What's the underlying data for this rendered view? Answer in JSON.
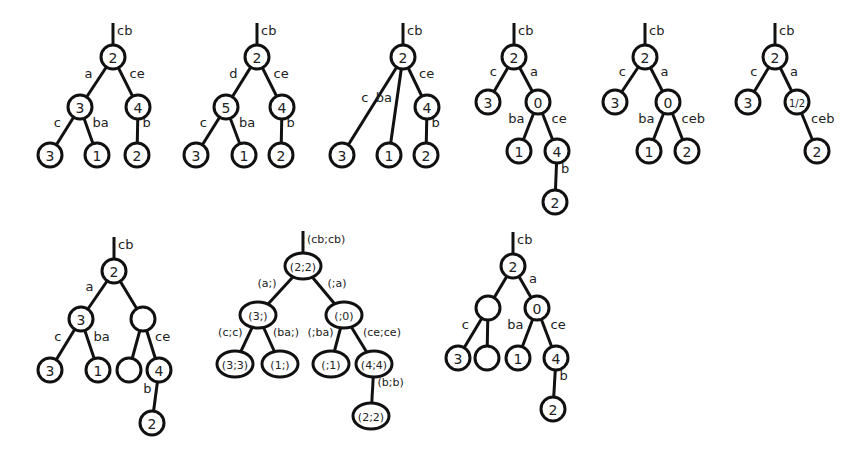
{
  "figure": {
    "trees": [
      {
        "id": "tree-1",
        "root_edge": "cb",
        "nodes": [
          {
            "id": "r",
            "label": "2",
            "x": 113,
            "y": 57
          },
          {
            "id": "a",
            "label": "3",
            "x": 80,
            "y": 107
          },
          {
            "id": "b",
            "label": "4",
            "x": 138,
            "y": 107
          },
          {
            "id": "c",
            "label": "3",
            "x": 50,
            "y": 155
          },
          {
            "id": "d",
            "label": "1",
            "x": 97,
            "y": 155
          },
          {
            "id": "e",
            "label": "2",
            "x": 137,
            "y": 155
          }
        ],
        "edges": [
          {
            "from": "r",
            "to": "a",
            "label": "a"
          },
          {
            "from": "r",
            "to": "b",
            "label": "ce"
          },
          {
            "from": "a",
            "to": "c",
            "label": "c"
          },
          {
            "from": "a",
            "to": "d",
            "label": "ba"
          },
          {
            "from": "b",
            "to": "e",
            "label": "b"
          }
        ]
      },
      {
        "id": "tree-2",
        "root_edge": "cb",
        "nodes": [
          {
            "id": "r",
            "label": "2",
            "x": 257,
            "y": 57
          },
          {
            "id": "a",
            "label": "5",
            "x": 226,
            "y": 107
          },
          {
            "id": "b",
            "label": "4",
            "x": 282,
            "y": 107
          },
          {
            "id": "c",
            "label": "3",
            "x": 196,
            "y": 155
          },
          {
            "id": "d",
            "label": "1",
            "x": 244,
            "y": 155
          },
          {
            "id": "e",
            "label": "2",
            "x": 281,
            "y": 155
          }
        ],
        "edges": [
          {
            "from": "r",
            "to": "a",
            "label": "d"
          },
          {
            "from": "r",
            "to": "b",
            "label": "ce"
          },
          {
            "from": "a",
            "to": "c",
            "label": "c"
          },
          {
            "from": "a",
            "to": "d",
            "label": "ba"
          },
          {
            "from": "b",
            "to": "e",
            "label": "b"
          }
        ]
      },
      {
        "id": "tree-3",
        "root_edge": "cb",
        "nodes": [
          {
            "id": "r",
            "label": "2",
            "x": 403,
            "y": 57
          },
          {
            "id": "b",
            "label": "4",
            "x": 427,
            "y": 107
          },
          {
            "id": "c",
            "label": "3",
            "x": 342,
            "y": 155
          },
          {
            "id": "d",
            "label": "1",
            "x": 389,
            "y": 155
          },
          {
            "id": "e",
            "label": "2",
            "x": 426,
            "y": 155
          }
        ],
        "edges": [
          {
            "from": "r",
            "to": "c",
            "label": "c"
          },
          {
            "from": "r",
            "to": "d",
            "label": "ba"
          },
          {
            "from": "r",
            "to": "b",
            "label": "ce"
          },
          {
            "from": "b",
            "to": "e",
            "label": "b"
          }
        ]
      },
      {
        "id": "tree-4",
        "root_edge": "cb",
        "nodes": [
          {
            "id": "r",
            "label": "2",
            "x": 514,
            "y": 57
          },
          {
            "id": "a",
            "label": "3",
            "x": 488,
            "y": 102
          },
          {
            "id": "b",
            "label": "0",
            "x": 538,
            "y": 102
          },
          {
            "id": "c",
            "label": "1",
            "x": 519,
            "y": 151
          },
          {
            "id": "d",
            "label": "4",
            "x": 557,
            "y": 151
          },
          {
            "id": "e",
            "label": "2",
            "x": 555,
            "y": 202
          }
        ],
        "edges": [
          {
            "from": "r",
            "to": "a",
            "label": "c"
          },
          {
            "from": "r",
            "to": "b",
            "label": "a"
          },
          {
            "from": "b",
            "to": "c",
            "label": "ba"
          },
          {
            "from": "b",
            "to": "d",
            "label": "ce"
          },
          {
            "from": "d",
            "to": "e",
            "label": "b"
          }
        ]
      },
      {
        "id": "tree-5",
        "root_edge": "cb",
        "nodes": [
          {
            "id": "r",
            "label": "2",
            "x": 645,
            "y": 57
          },
          {
            "id": "a",
            "label": "3",
            "x": 615,
            "y": 102
          },
          {
            "id": "b",
            "label": "0",
            "x": 668,
            "y": 102
          },
          {
            "id": "c",
            "label": "1",
            "x": 649,
            "y": 151
          },
          {
            "id": "d",
            "label": "2",
            "x": 687,
            "y": 151
          }
        ],
        "edges": [
          {
            "from": "r",
            "to": "a",
            "label": "c"
          },
          {
            "from": "r",
            "to": "b",
            "label": "a"
          },
          {
            "from": "b",
            "to": "c",
            "label": "ba"
          },
          {
            "from": "b",
            "to": "d",
            "label": "ceb"
          }
        ]
      },
      {
        "id": "tree-6",
        "root_edge": "cb",
        "nodes": [
          {
            "id": "r",
            "label": "2",
            "x": 775,
            "y": 57
          },
          {
            "id": "a",
            "label": "3",
            "x": 748,
            "y": 102
          },
          {
            "id": "b",
            "label": "1/2",
            "x": 797,
            "y": 102,
            "small": true
          },
          {
            "id": "c",
            "label": "2",
            "x": 817,
            "y": 151
          }
        ],
        "edges": [
          {
            "from": "r",
            "to": "a",
            "label": "c"
          },
          {
            "from": "r",
            "to": "b",
            "label": "a"
          },
          {
            "from": "b",
            "to": "c",
            "label": "ceb"
          }
        ]
      },
      {
        "id": "tree-7",
        "root_edge": "cb",
        "nodes": [
          {
            "id": "r",
            "label": "2",
            "x": 114,
            "y": 271
          },
          {
            "id": "a",
            "label": "3",
            "x": 81,
            "y": 319
          },
          {
            "id": "b",
            "label": "",
            "x": 143,
            "y": 319
          },
          {
            "id": "c",
            "label": "3",
            "x": 50,
            "y": 370
          },
          {
            "id": "d",
            "label": "1",
            "x": 98,
            "y": 370
          },
          {
            "id": "e",
            "label": "",
            "x": 129,
            "y": 370
          },
          {
            "id": "f",
            "label": "4",
            "x": 159,
            "y": 370
          },
          {
            "id": "g",
            "label": "2",
            "x": 152,
            "y": 423
          }
        ],
        "edges": [
          {
            "from": "r",
            "to": "a",
            "label": "a"
          },
          {
            "from": "r",
            "to": "b",
            "label": ""
          },
          {
            "from": "a",
            "to": "c",
            "label": "c"
          },
          {
            "from": "a",
            "to": "d",
            "label": "ba"
          },
          {
            "from": "b",
            "to": "e",
            "label": ""
          },
          {
            "from": "b",
            "to": "f",
            "label": "ce"
          },
          {
            "from": "f",
            "to": "g",
            "label": "b"
          }
        ]
      },
      {
        "id": "tree-8",
        "root_edge": "(cb;cb)",
        "pair": true,
        "nodes": [
          {
            "id": "r",
            "label": "(2;2)",
            "x": 303,
            "y": 266
          },
          {
            "id": "a",
            "label": "(3;)",
            "x": 258,
            "y": 315
          },
          {
            "id": "b",
            "label": "(;0)",
            "x": 344,
            "y": 315
          },
          {
            "id": "c",
            "label": "(3;3)",
            "x": 235,
            "y": 364
          },
          {
            "id": "d",
            "label": "(1;)",
            "x": 280,
            "y": 364
          },
          {
            "id": "e",
            "label": "(;1)",
            "x": 331,
            "y": 364
          },
          {
            "id": "f",
            "label": "(4;4)",
            "x": 374,
            "y": 364
          },
          {
            "id": "g",
            "label": "(2;2)",
            "x": 371,
            "y": 416
          }
        ],
        "edges": [
          {
            "from": "r",
            "to": "a",
            "label": "(a;)"
          },
          {
            "from": "r",
            "to": "b",
            "label": "(;a)"
          },
          {
            "from": "a",
            "to": "c",
            "label": "(c;c)"
          },
          {
            "from": "a",
            "to": "d",
            "label": "(ba;)"
          },
          {
            "from": "b",
            "to": "e",
            "label": "(;ba)"
          },
          {
            "from": "b",
            "to": "f",
            "label": "(ce;ce)"
          },
          {
            "from": "f",
            "to": "g",
            "label": "(b;b)"
          }
        ]
      },
      {
        "id": "tree-9",
        "root_edge": "cb",
        "nodes": [
          {
            "id": "r",
            "label": "2",
            "x": 513,
            "y": 266
          },
          {
            "id": "a",
            "label": "",
            "x": 488,
            "y": 308
          },
          {
            "id": "b",
            "label": "0",
            "x": 537,
            "y": 308
          },
          {
            "id": "c",
            "label": "3",
            "x": 458,
            "y": 358
          },
          {
            "id": "d",
            "label": "",
            "x": 487,
            "y": 358
          },
          {
            "id": "e",
            "label": "1",
            "x": 518,
            "y": 358
          },
          {
            "id": "f",
            "label": "4",
            "x": 556,
            "y": 358
          },
          {
            "id": "g",
            "label": "2",
            "x": 553,
            "y": 409
          }
        ],
        "edges": [
          {
            "from": "r",
            "to": "a",
            "label": ""
          },
          {
            "from": "r",
            "to": "b",
            "label": "a"
          },
          {
            "from": "a",
            "to": "c",
            "label": "c"
          },
          {
            "from": "a",
            "to": "d",
            "label": ""
          },
          {
            "from": "b",
            "to": "e",
            "label": "ba"
          },
          {
            "from": "b",
            "to": "f",
            "label": "ce"
          },
          {
            "from": "f",
            "to": "g",
            "label": "b"
          }
        ]
      }
    ]
  }
}
